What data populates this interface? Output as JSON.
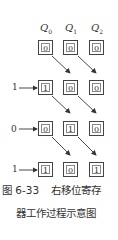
{
  "registers": [
    "Q0",
    "Q1",
    "Q2"
  ],
  "register_labels": [
    {
      "main": "Q",
      "sub": "0"
    },
    {
      "main": "Q",
      "sub": "1"
    },
    {
      "main": "Q",
      "sub": "2"
    }
  ],
  "rows": [
    {
      "input": "",
      "values": [
        "0",
        "0",
        "0"
      ]
    },
    {
      "input": "1",
      "values": [
        "1",
        "0",
        "0"
      ]
    },
    {
      "input": "0",
      "values": [
        "0",
        "1",
        "0"
      ]
    },
    {
      "input": "1",
      "values": [
        "1",
        "0",
        "1"
      ]
    }
  ],
  "caption": {
    "figure_number": "图 6-33",
    "line1_text": "右移位寄存",
    "line2_text": "器工作过程示意图"
  }
}
